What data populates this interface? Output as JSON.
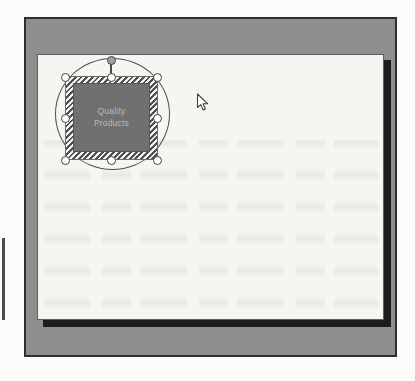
{
  "window": {
    "frame_color": "#8e8e8e",
    "border_color": "#2f2f2f"
  },
  "canvas": {
    "background_color": "#f6f5f2",
    "shadow_color": "#1c1c1c"
  },
  "shape": {
    "label": "Quality Products",
    "fill_color": "#707070",
    "text_color": "#bababa"
  },
  "selection": {
    "handle_count": 8,
    "has_rotation_handle": true,
    "hatch_color": "#4f4f4f",
    "handle_fill": "#fdfdfd"
  },
  "icons": {
    "cursor": "arrow-pointer-icon"
  }
}
